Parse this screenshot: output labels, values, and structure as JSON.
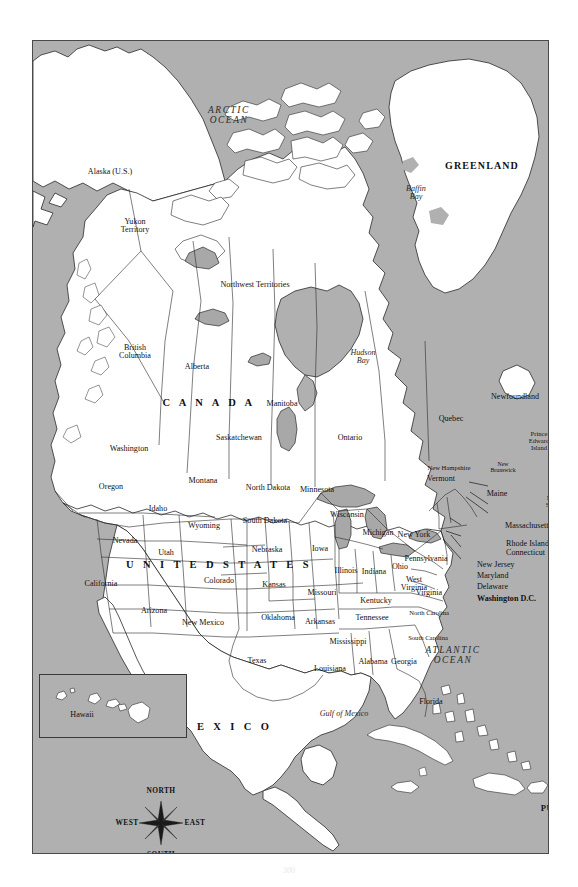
{
  "figure": {
    "page_number": "300"
  },
  "map": {
    "background_color": "#b0b0b0",
    "land_color": "#ffffff",
    "border_color": "#4a4a4a",
    "oceans": [
      {
        "name": "ARCTIC OCEAN",
        "lines": [
          "ARCTIC",
          "OCEAN"
        ],
        "x": 196,
        "y": 75
      },
      {
        "name": "PACIFIC OCEAN",
        "lines": [
          "PACIFIC",
          "OCEAN"
        ],
        "x": 63,
        "y": 651
      },
      {
        "name": "ATLANTIC OCEAN",
        "lines": [
          "ATLANTIC",
          "OCEAN"
        ],
        "x": 420,
        "y": 615
      }
    ],
    "water_bodies": [
      {
        "name": "Baffin Bay",
        "lines": [
          "Baffin",
          "Bay"
        ],
        "x": 383,
        "y": 152
      },
      {
        "name": "Hudson Bay",
        "lines": [
          "Hudson",
          "Bay"
        ],
        "x": 330,
        "y": 316
      },
      {
        "name": "Gulf of Mexico",
        "lines": [
          "Gulf of Mexico"
        ],
        "x": 311,
        "y": 673
      }
    ],
    "countries": [
      {
        "name": "CANADA",
        "label": "C A N A D A",
        "x": 176,
        "y": 362
      },
      {
        "name": "UNITED STATES",
        "label": "U N I T E D   S T A T E S",
        "x": 186,
        "y": 524
      },
      {
        "name": "MEXICO",
        "label": "M E X I C O",
        "x": 192,
        "y": 686
      },
      {
        "name": "GREENLAND",
        "label": "GREENLAND",
        "x": 449,
        "y": 125
      }
    ],
    "territories": [
      {
        "name": "Puerto Rico",
        "lines": [
          "PUERTO",
          "RICO"
        ],
        "x": 527,
        "y": 772
      },
      {
        "name": "Alaska (U.S.)",
        "lines": [
          "Alaska (U.S.)"
        ],
        "x": 77,
        "y": 131
      }
    ],
    "provinces": [
      {
        "name": "Yukon Territory",
        "lines": [
          "Yukon",
          "Territory"
        ],
        "x": 102,
        "y": 185
      },
      {
        "name": "Northwest Territories",
        "lines": [
          "Northwest Territories"
        ],
        "x": 222,
        "y": 244
      },
      {
        "name": "British Columbia",
        "lines": [
          "British",
          "Columbia"
        ],
        "x": 102,
        "y": 311
      },
      {
        "name": "Alberta",
        "lines": [
          "Alberta"
        ],
        "x": 164,
        "y": 326
      },
      {
        "name": "Saskatchewan",
        "lines": [
          "Saskatchewan"
        ],
        "x": 206,
        "y": 397
      },
      {
        "name": "Manitoba",
        "lines": [
          "Manitoba"
        ],
        "x": 249,
        "y": 363
      },
      {
        "name": "Ontario",
        "lines": [
          "Ontario"
        ],
        "x": 317,
        "y": 397
      },
      {
        "name": "Quebec",
        "lines": [
          "Quebec"
        ],
        "x": 418,
        "y": 378
      },
      {
        "name": "Newfoundland",
        "lines": [
          "Newfoundland"
        ],
        "x": 482,
        "y": 356
      },
      {
        "name": "New Brunswick",
        "lines": [
          "New",
          "Brunswick"
        ],
        "x": 470,
        "y": 426
      },
      {
        "name": "Prince Edward Island",
        "lines": [
          "Prince",
          "Edward",
          "Island"
        ],
        "x": 506,
        "y": 400
      },
      {
        "name": "Nova Scotia",
        "lines": [
          "Nova",
          "Scotia"
        ],
        "x": 521,
        "y": 461
      }
    ],
    "states": [
      {
        "name": "Washington",
        "lines": [
          "Washington"
        ],
        "x": 96,
        "y": 408
      },
      {
        "name": "Oregon",
        "lines": [
          "Oregon"
        ],
        "x": 78,
        "y": 446
      },
      {
        "name": "Idaho",
        "lines": [
          "Idaho"
        ],
        "x": 125,
        "y": 468
      },
      {
        "name": "Montana",
        "lines": [
          "Montana"
        ],
        "x": 170,
        "y": 440
      },
      {
        "name": "Wyoming",
        "lines": [
          "Wyoming"
        ],
        "x": 171,
        "y": 485
      },
      {
        "name": "Nevada",
        "lines": [
          "Nevada"
        ],
        "x": 92,
        "y": 500
      },
      {
        "name": "Utah",
        "lines": [
          "Utah"
        ],
        "x": 133,
        "y": 512
      },
      {
        "name": "California",
        "lines": [
          "California"
        ],
        "x": 68,
        "y": 543
      },
      {
        "name": "Arizona",
        "lines": [
          "Arizona"
        ],
        "x": 121,
        "y": 570
      },
      {
        "name": "Colorado",
        "lines": [
          "Colorado"
        ],
        "x": 186,
        "y": 540
      },
      {
        "name": "New Mexico",
        "lines": [
          "New Mexico"
        ],
        "x": 170,
        "y": 582
      },
      {
        "name": "North Dakota",
        "lines": [
          "North Dakota"
        ],
        "x": 235,
        "y": 447
      },
      {
        "name": "South Dakota",
        "lines": [
          "South Dakota"
        ],
        "x": 232,
        "y": 480
      },
      {
        "name": "Nebraska",
        "lines": [
          "Nebraska"
        ],
        "x": 234,
        "y": 509
      },
      {
        "name": "Kansas",
        "lines": [
          "Kansas"
        ],
        "x": 241,
        "y": 544
      },
      {
        "name": "Oklahoma",
        "lines": [
          "Oklahoma"
        ],
        "x": 245,
        "y": 577
      },
      {
        "name": "Texas",
        "lines": [
          "Texas"
        ],
        "x": 224,
        "y": 620
      },
      {
        "name": "Minnesota",
        "lines": [
          "Minnesota"
        ],
        "x": 284,
        "y": 449
      },
      {
        "name": "Iowa",
        "lines": [
          "Iowa"
        ],
        "x": 287,
        "y": 508
      },
      {
        "name": "Missouri",
        "lines": [
          "Missouri"
        ],
        "x": 289,
        "y": 552
      },
      {
        "name": "Arkansas",
        "lines": [
          "Arkansas"
        ],
        "x": 287,
        "y": 581
      },
      {
        "name": "Louisiana",
        "lines": [
          "Louisiana"
        ],
        "x": 297,
        "y": 628
      },
      {
        "name": "Wisconsin",
        "lines": [
          "Wisconsin"
        ],
        "x": 314,
        "y": 474
      },
      {
        "name": "Illinois",
        "lines": [
          "Illinois"
        ],
        "x": 313,
        "y": 530
      },
      {
        "name": "Michigan",
        "lines": [
          "Michigan"
        ],
        "x": 345,
        "y": 492
      },
      {
        "name": "Indiana",
        "lines": [
          "Indiana"
        ],
        "x": 341,
        "y": 531
      },
      {
        "name": "Ohio",
        "lines": [
          "Ohio"
        ],
        "x": 367,
        "y": 526
      },
      {
        "name": "Kentucky",
        "lines": [
          "Kentucky"
        ],
        "x": 343,
        "y": 560
      },
      {
        "name": "Tennessee",
        "lines": [
          "Tennessee"
        ],
        "x": 339,
        "y": 577
      },
      {
        "name": "Mississippi",
        "lines": [
          "Mississippi"
        ],
        "x": 315,
        "y": 601
      },
      {
        "name": "Alabama",
        "lines": [
          "Alabama"
        ],
        "x": 340,
        "y": 621
      },
      {
        "name": "Georgia",
        "lines": [
          "Georgia"
        ],
        "x": 371,
        "y": 621
      },
      {
        "name": "Florida",
        "lines": [
          "Florida"
        ],
        "x": 398,
        "y": 661
      },
      {
        "name": "South Carolina",
        "lines": [
          "South Carolina"
        ],
        "x": 395,
        "y": 597
      },
      {
        "name": "North Carolina",
        "lines": [
          "North Carolina"
        ],
        "x": 396,
        "y": 572
      },
      {
        "name": "Virginia",
        "lines": [
          "Virginia"
        ],
        "x": 396,
        "y": 552
      },
      {
        "name": "West Virginia",
        "lines": [
          "West",
          "Virginia"
        ],
        "x": 381,
        "y": 543
      },
      {
        "name": "Pennsylvania",
        "lines": [
          "Pennsylvania"
        ],
        "x": 393,
        "y": 518
      },
      {
        "name": "New York",
        "lines": [
          "New York"
        ],
        "x": 381,
        "y": 494
      },
      {
        "name": "Vermont",
        "lines": [
          "Vermont"
        ],
        "x": 408,
        "y": 438
      },
      {
        "name": "New Hampshire",
        "lines": [
          "New Hampshire"
        ],
        "x": 416,
        "y": 427
      },
      {
        "name": "Maine",
        "lines": [
          "Maine"
        ],
        "x": 464,
        "y": 453
      }
    ],
    "callout_states": [
      {
        "name": "Massachusetts",
        "label": "Massachusetts",
        "x": 472,
        "y": 485,
        "lx1": 455,
        "ly1": 485,
        "lx2": 436,
        "ly2": 481
      },
      {
        "name": "Rhode Island",
        "label": "Rhode Island",
        "x": 473,
        "y": 503,
        "lx1": 455,
        "ly1": 503,
        "lx2": 437,
        "ly2": 491
      },
      {
        "name": "Connecticut",
        "label": "Connecticut",
        "x": 473,
        "y": 512,
        "lx1": 455,
        "ly1": 512,
        "lx2": 433,
        "ly2": 496
      },
      {
        "name": "New Jersey",
        "label": "New Jersey",
        "x": 444,
        "y": 524,
        "lx1": 428,
        "ly1": 524,
        "lx2": 417,
        "ly2": 517
      },
      {
        "name": "Maryland",
        "label": "Maryland",
        "x": 444,
        "y": 535,
        "lx1": 428,
        "ly1": 535,
        "lx2": 413,
        "ly2": 530
      },
      {
        "name": "Delaware",
        "label": "Delaware",
        "x": 444,
        "y": 546,
        "lx1": 428,
        "ly1": 546,
        "lx2": 418,
        "ly2": 534
      },
      {
        "name": "Washington D.C.",
        "label": "Washington D.C.",
        "x": 444,
        "y": 558,
        "lx1": 428,
        "ly1": 558,
        "lx2": 410,
        "ly2": 538
      }
    ],
    "inset": {
      "name": "Hawaii",
      "label": "Hawaii",
      "x": 74,
      "y": 705
    },
    "compass": {
      "north": "NORTH",
      "south": "SOUTH",
      "east": "EAST",
      "west": "WEST"
    }
  }
}
